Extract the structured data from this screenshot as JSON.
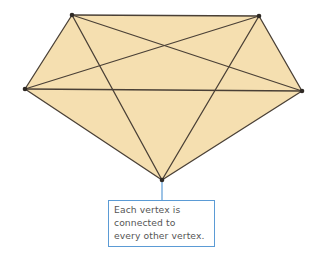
{
  "diagram": {
    "fill_color": "#F5DFB0",
    "edge_color": "#4a4036",
    "vertex_color": "#2f2a25",
    "callout_color": "#5b9bd5",
    "vertices": [
      {
        "id": "top-left",
        "x": 72,
        "y": 15
      },
      {
        "id": "top-right",
        "x": 259,
        "y": 16
      },
      {
        "id": "right",
        "x": 302,
        "y": 91
      },
      {
        "id": "bottom",
        "x": 162,
        "y": 180
      },
      {
        "id": "left",
        "x": 25,
        "y": 89
      }
    ],
    "edges": [
      [
        "top-left",
        "top-right"
      ],
      [
        "top-right",
        "right"
      ],
      [
        "right",
        "bottom"
      ],
      [
        "bottom",
        "left"
      ],
      [
        "left",
        "top-left"
      ],
      [
        "top-left",
        "right"
      ],
      [
        "top-left",
        "bottom"
      ],
      [
        "top-right",
        "left"
      ],
      [
        "top-right",
        "bottom"
      ],
      [
        "left",
        "right"
      ]
    ]
  },
  "callout": {
    "lines": [
      "Each vertex is",
      "connected to",
      "every other vertex."
    ]
  }
}
